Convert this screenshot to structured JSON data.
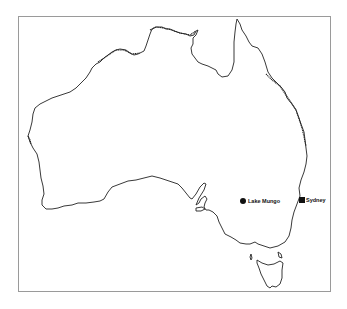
{
  "map": {
    "region": "Australia",
    "frame": {
      "border_color": "#9a9a9a"
    },
    "coastline_color": "#222222",
    "markers": [
      {
        "name": "Lake Mungo",
        "shape": "circle",
        "x": 243,
        "y": 201
      },
      {
        "name": "Sydney",
        "shape": "square",
        "x": 302,
        "y": 200
      }
    ]
  }
}
